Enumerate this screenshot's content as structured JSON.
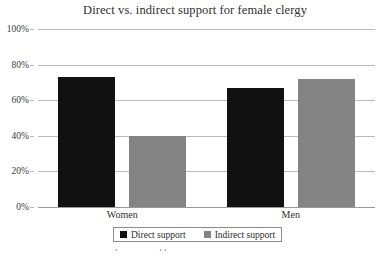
{
  "chart_data": {
    "type": "bar",
    "title": "Direct vs. indirect support for female clergy",
    "xlabel": "",
    "ylabel": "",
    "categories": [
      "Women",
      "Men"
    ],
    "series": [
      {
        "name": "Direct support",
        "color": "#111111",
        "values": [
          73,
          67
        ]
      },
      {
        "name": "Indirect support",
        "color": "#848484",
        "values": [
          40,
          72
        ]
      }
    ],
    "ylim": [
      0,
      100
    ],
    "yticks": [
      0,
      20,
      40,
      60,
      80,
      100
    ],
    "ytick_labels": [
      "0%",
      "20%",
      "40%",
      "60%",
      "80%",
      "100%"
    ],
    "grid": true,
    "legend_position": "bottom-center",
    "value_format": "percent"
  },
  "legend": {
    "entries": [
      {
        "label": "Direct support",
        "swatch": "black-square-swatch"
      },
      {
        "label": "Indirect support",
        "swatch": "gray-square-swatch"
      }
    ]
  },
  "caption": {
    "partial_text": "Such and Politics: Response to Support"
  }
}
